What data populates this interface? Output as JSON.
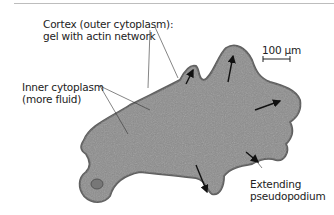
{
  "figure": {
    "labels": {
      "cortex_line1": "Cortex (outer cytoplasm):",
      "cortex_line2": "gel with actin network",
      "inner_line1": "Inner cytoplasm",
      "inner_line2": "(more fluid)",
      "pseudo_line1": "Extending",
      "pseudo_line2": "pseudopodium",
      "scale": "100 µm"
    },
    "colors": {
      "cell": "#8a8a8a",
      "cell_edge": "#5e5e5e",
      "text": "#222222",
      "rule": "#bdbdbd"
    }
  }
}
